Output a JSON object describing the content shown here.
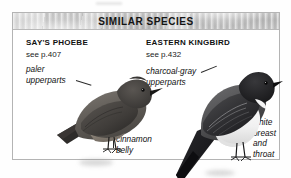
{
  "panel": {
    "title": "SIMILAR SPECIES",
    "header_bg": "#c6c6c6",
    "border_color": "#b4b4b4",
    "background": "#ffffff"
  },
  "species": [
    {
      "id": "says-phoebe",
      "name": "SAY'S PHOEBE",
      "page_ref": "see p.407",
      "annotations": [
        {
          "id": "paler-upperparts",
          "line1": "paler",
          "line2": "upperparts"
        },
        {
          "id": "cinnamon-belly",
          "line1": "cinnamon",
          "line2": "belly"
        }
      ],
      "illustration": {
        "name": "says-phoebe-illustration",
        "body_color": "#5e5a56",
        "upper_color": "#6e6a65",
        "belly_color": "#8a8076",
        "head_color": "#4a4744",
        "bill_color": "#1d1b1a"
      }
    },
    {
      "id": "eastern-kingbird",
      "name": "EASTERN KINGBIRD",
      "page_ref": "see p.432",
      "annotations": [
        {
          "id": "charcoal-gray-upperparts",
          "line1": "charcoal-gray",
          "line2": "upperparts"
        },
        {
          "id": "white-breast-and-throat",
          "line1": "white",
          "line2": "breast",
          "line3": "and",
          "line4": "throat"
        }
      ],
      "illustration": {
        "name": "eastern-kingbird-illustration",
        "body_color": "#4b4b4d",
        "upper_color": "#58585a",
        "breast_color": "#f2f2f2",
        "head_color": "#1c1c1e",
        "bill_color": "#141414",
        "tail_color": "#16161a"
      }
    }
  ]
}
